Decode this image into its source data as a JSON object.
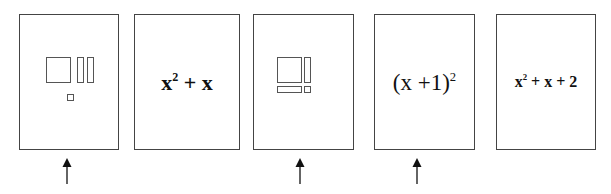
{
  "figure": {
    "type": "card-selection-diagram",
    "cards": [
      {
        "id": 1,
        "kind": "algebra-tiles",
        "tiles": [
          "x-squared-square",
          "x-bar",
          "x-bar",
          "unit-square"
        ],
        "arrow": true
      },
      {
        "id": 2,
        "kind": "expression",
        "base": "x",
        "exp": "2",
        "rest": " + x",
        "style": "bold",
        "arrow": false
      },
      {
        "id": 3,
        "kind": "algebra-tiles",
        "tiles": [
          "x-squared-square",
          "x-bar-vertical",
          "x-bar-horizontal",
          "unit-square"
        ],
        "arrow": true
      },
      {
        "id": 4,
        "kind": "expression",
        "base": "(x +1)",
        "exp": "2",
        "rest": "",
        "style": "regular",
        "arrow": true
      },
      {
        "id": 5,
        "kind": "expression",
        "base": "x",
        "exp": "2",
        "rest": " + x + 2",
        "style": "bold",
        "arrow": false
      }
    ]
  },
  "colors": {
    "border": "#444444",
    "tile": "#555555",
    "text": "#111111"
  }
}
